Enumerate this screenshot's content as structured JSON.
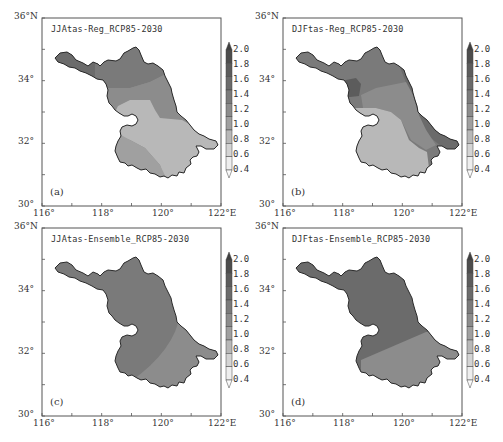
{
  "figure": {
    "top_text_cut": "（截断的中文说明文字）"
  },
  "chart_data": [
    {
      "type": "heatmap",
      "panel": "(a)",
      "title": "JJAtas-Reg_RCP85-2030",
      "xlabel": "",
      "ylabel": "",
      "xticks": [
        "116°",
        "118°",
        "120°",
        "122°E"
      ],
      "yticks": [
        "30°",
        "32°",
        "34°",
        "36°N"
      ],
      "xlim": [
        116,
        122
      ],
      "ylim": [
        30,
        36
      ],
      "colorbar": {
        "levels": [
          0.4,
          0.6,
          0.8,
          1.0,
          1.2,
          1.4,
          1.6,
          1.8,
          2.0
        ],
        "extend": "both",
        "labels": [
          "2.0",
          "1.8",
          "1.6",
          "1.4",
          "1.2",
          "1.0",
          "0.8",
          "0.6",
          "0.4"
        ]
      },
      "regions": [
        {
          "area": "northwest",
          "value_range": [
            1.2,
            1.4
          ]
        },
        {
          "area": "north-central",
          "value_range": [
            1.0,
            1.2
          ]
        },
        {
          "area": "central band",
          "value_range": [
            0.8,
            1.0
          ]
        },
        {
          "area": "central-south / southeast",
          "value_range": [
            0.6,
            0.8
          ]
        },
        {
          "area": "southwest",
          "value_range": [
            0.8,
            1.0
          ]
        }
      ]
    },
    {
      "type": "heatmap",
      "panel": "(b)",
      "title": "DJFtas-Reg_RCP85-2030",
      "xticks": [
        "116°",
        "118°",
        "120°",
        "122°E"
      ],
      "yticks": [
        "30°",
        "32°",
        "34°",
        "36°N"
      ],
      "xlim": [
        116,
        122
      ],
      "ylim": [
        30,
        36
      ],
      "colorbar": {
        "levels": [
          0.4,
          0.6,
          0.8,
          1.0,
          1.2,
          1.4,
          1.6,
          1.8,
          2.0
        ],
        "extend": "both",
        "labels": [
          "2.0",
          "1.8",
          "1.6",
          "1.4",
          "1.2",
          "1.0",
          "0.8",
          "0.6",
          "0.4"
        ]
      },
      "regions": [
        {
          "area": "north / northeast coast",
          "value_range": [
            1.2,
            1.6
          ]
        },
        {
          "area": "west-central patch",
          "value_range": [
            1.4,
            1.6
          ]
        },
        {
          "area": "central band",
          "value_range": [
            0.8,
            1.0
          ]
        },
        {
          "area": "south",
          "value_range": [
            0.6,
            0.8
          ]
        },
        {
          "area": "southeast tip",
          "value_range": [
            1.2,
            1.4
          ]
        }
      ]
    },
    {
      "type": "heatmap",
      "panel": "(c)",
      "title": "JJAtas-Ensemble_RCP85-2030",
      "xticks": [
        "116°",
        "118°",
        "120°",
        "122°E"
      ],
      "yticks": [
        "30°",
        "32°",
        "34°",
        "36°N"
      ],
      "xlim": [
        116,
        122
      ],
      "ylim": [
        30,
        36
      ],
      "colorbar": {
        "levels": [
          0.4,
          0.6,
          0.8,
          1.0,
          1.2,
          1.4,
          1.6,
          1.8,
          2.0
        ],
        "extend": "both",
        "labels": [
          "2.0",
          "1.8",
          "1.6",
          "1.4",
          "1.2",
          "1.0",
          "0.8",
          "0.6",
          "0.4"
        ]
      },
      "regions": [
        {
          "area": "most of province",
          "value_range": [
            1.2,
            1.4
          ]
        },
        {
          "area": "southeast",
          "value_range": [
            1.0,
            1.2
          ]
        }
      ]
    },
    {
      "type": "heatmap",
      "panel": "(d)",
      "title": "DJFtas-Ensemble_RCP85-2030",
      "xticks": [
        "116°",
        "118°",
        "120°",
        "122°E"
      ],
      "yticks": [
        "30°",
        "32°",
        "34°",
        "36°N"
      ],
      "xlim": [
        116,
        122
      ],
      "ylim": [
        30,
        36
      ],
      "colorbar": {
        "levels": [
          0.4,
          0.6,
          0.8,
          1.0,
          1.2,
          1.4,
          1.6,
          1.8,
          2.0
        ],
        "extend": "both",
        "labels": [
          "2.0",
          "1.8",
          "1.6",
          "1.4",
          "1.2",
          "1.0",
          "0.8",
          "0.6",
          "0.4"
        ]
      },
      "regions": [
        {
          "area": "most of province",
          "value_range": [
            1.4,
            1.6
          ]
        },
        {
          "area": "southeast",
          "value_range": [
            1.0,
            1.2
          ]
        }
      ]
    }
  ],
  "panels": [
    {
      "title": "JJAtas-Reg_RCP85-2030",
      "label": "(a)"
    },
    {
      "title": "DJFtas-Reg_RCP85-2030",
      "label": "(b)"
    },
    {
      "title": "JJAtas-Ensemble_RCP85-2030",
      "label": "(c)"
    },
    {
      "title": "DJFtas-Ensemble_RCP85-2030",
      "label": "(d)"
    }
  ],
  "axes": {
    "xticks": [
      "116°",
      "118°",
      "120°",
      "122°E"
    ],
    "yticks": [
      "36°N",
      "34°",
      "32°",
      "30°"
    ]
  },
  "colorbar": {
    "labels": [
      "2.0",
      "1.8",
      "1.6",
      "1.4",
      "1.2",
      "1.0",
      "0.8",
      "0.6",
      "0.4"
    ],
    "colors": [
      "#3f3f3f",
      "#4d4d4d",
      "#5c5c5c",
      "#6b6b6b",
      "#7a7a7a",
      "#8c8c8c",
      "#a0a0a0",
      "#b8b8b8",
      "#d4d4d4",
      "#eeeeee"
    ]
  },
  "colors": {
    "frame": "#555555",
    "outline": "#2a2a2a",
    "c_1_2": "#7a7a7a",
    "c_1_0": "#8c8c8c",
    "c_0_8": "#a0a0a0",
    "c_0_6": "#b8b8b8",
    "c_1_4": "#6b6b6b",
    "c_1_6": "#5c5c5c",
    "c_0_4": "#d4d4d4"
  }
}
